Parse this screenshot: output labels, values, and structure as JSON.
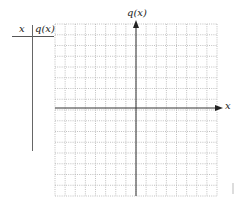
{
  "table": {
    "col_x_header": "x",
    "col_q_header": "q(x)",
    "rows": []
  },
  "graph": {
    "y_axis_label": "q(x)",
    "x_axis_label": "x",
    "grid": {
      "columns": 16,
      "rows": 16,
      "style": "dotted"
    },
    "colors": {
      "grid": "#b0b0b0",
      "axis": "#333333",
      "table_lines": "#555555"
    }
  }
}
